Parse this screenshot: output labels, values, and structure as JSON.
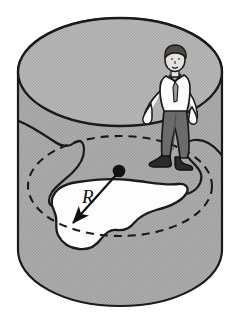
{
  "figure": {
    "label_r": "R",
    "dot_label": "center-point",
    "shapes": {
      "cylinder": {
        "name": "gray-cylinder",
        "fill_color": "#a9a9a9",
        "stroke_color": "#1a1a1a",
        "top_ellipse_center": [
          120,
          72
        ],
        "top_ellipse_radii": [
          102,
          54
        ],
        "body_left_x": 18,
        "body_right_x": 222,
        "bottom_y": 306
      },
      "dashed_circle": {
        "name": "dashed-radius-circle",
        "stroke_color": "#1a1a1a",
        "dash_pattern": "7 5",
        "center": [
          120,
          186
        ],
        "radii": [
          92,
          50
        ]
      },
      "puddle": {
        "name": "white-irregular-region",
        "fill_color": "#fdfdfd",
        "stroke_color": "#1a1a1a"
      },
      "center_dot": {
        "name": "center-dot",
        "fill_color": "#111111",
        "position": [
          119,
          172
        ],
        "radius": 6
      },
      "radius_arrow": {
        "name": "radius-arrow",
        "from": [
          119,
          172
        ],
        "to": [
          71,
          225
        ],
        "stroke_color": "#111111"
      },
      "person": {
        "name": "standing-person",
        "hair_color": "#4a4a4a",
        "skin_color": "#e8e2dc",
        "shirt_color": "#fbfbfb",
        "tie_color": "#9a9a9a",
        "trousers_color": "#6b6b6b",
        "shoes_color": "#2a2a2a",
        "position": [
          175,
          110
        ]
      }
    },
    "colors": {
      "background": "#ffffff",
      "gray_fill": "#a9a9a9",
      "gray_fill_light": "#b4b4b4",
      "ink": "#1a1a1a",
      "white_region": "#fdfdfd"
    }
  }
}
